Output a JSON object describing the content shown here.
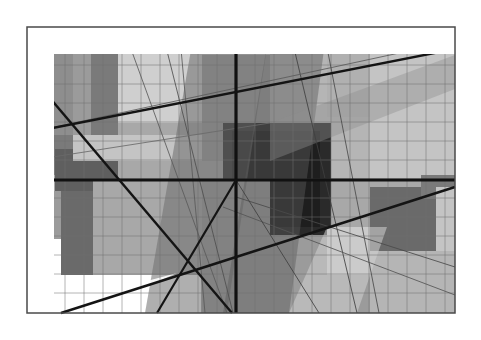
{
  "image": {
    "title": "Abstract Geometric Composition",
    "width": 481,
    "height": 340,
    "background_color": "#ffffff",
    "medium": "flat-color geometric abstraction",
    "style": "neoplastic / constructivist grid with overlaid diagonals"
  },
  "frame": {
    "name": "artwork-frame",
    "x": 27,
    "y": 27,
    "width": 428,
    "height": 286,
    "border_color": "#4a4a4a",
    "border_width": 1.5,
    "base_fill": "#a8a8a8"
  },
  "palette": {
    "white": "#ffffff",
    "near_white": "#f2f2f2",
    "light_gray": "#cfcfcf",
    "light_gray_2": "#c4c4c4",
    "mid_light_gray": "#b5b5b5",
    "mid_gray": "#a8a8a8",
    "mid_gray_2": "#9b9b9b",
    "gray": "#8e8e8e",
    "dark_gray": "#7a7a7a",
    "darker_gray": "#6a6a6a",
    "deep_gray": "#4f4f4f",
    "charcoal": "#3a3a3a",
    "near_black": "#1e1e1e",
    "black": "#111111",
    "grid_line": "#6f6f6f",
    "thin_line": "#555555"
  },
  "chart_data": {
    "type": "scatter",
    "xlabel": "",
    "ylabel": "",
    "xlim": [
      0,
      428
    ],
    "ylim": [
      0,
      286
    ],
    "grid": true,
    "legend": "none",
    "grid_vertical_x": [
      19,
      38,
      57,
      76,
      95,
      114,
      133,
      152,
      171,
      190,
      209,
      228,
      247,
      266,
      285,
      304,
      323,
      342,
      361,
      380,
      399,
      418
    ],
    "grid_horizontal_y": [
      19,
      38,
      57,
      76,
      95,
      114,
      133,
      152,
      171,
      190,
      209,
      228,
      247,
      266
    ],
    "rect_fields": [
      {
        "label": "left-dark-band-top",
        "x": 0,
        "y": 0,
        "w": 46,
        "h": 132,
        "fill": "#8e8e8e"
      },
      {
        "label": "left-pale-column",
        "x": 46,
        "y": 0,
        "w": 18,
        "h": 132,
        "fill": "#9b9b9b"
      },
      {
        "label": "second-dark-column",
        "x": 64,
        "y": 0,
        "w": 27,
        "h": 132,
        "fill": "#7a7a7a"
      },
      {
        "label": "upper-light-plane",
        "x": 91,
        "y": 0,
        "w": 84,
        "h": 96,
        "fill": "#cfcfcf"
      },
      {
        "label": "upper-mid-block",
        "x": 175,
        "y": 28,
        "w": 68,
        "h": 104,
        "fill": "#9b9b9b"
      },
      {
        "label": "upper-pale-strip",
        "x": 175,
        "y": 0,
        "w": 68,
        "h": 28,
        "fill": "#c4c4c4"
      },
      {
        "label": "upper-right-field",
        "x": 243,
        "y": 0,
        "w": 100,
        "h": 152,
        "fill": "#b5b5b5"
      },
      {
        "label": "far-right-light",
        "x": 343,
        "y": 0,
        "w": 85,
        "h": 152,
        "fill": "#c4c4c4"
      },
      {
        "label": "right-upper-tint",
        "x": 300,
        "y": 14,
        "w": 43,
        "h": 76,
        "fill": "#b0b0b0"
      },
      {
        "label": "midband-left-dark",
        "x": 0,
        "y": 108,
        "w": 46,
        "h": 40,
        "fill": "#7a7a7a"
      },
      {
        "label": "midband-left-darker",
        "x": 28,
        "y": 122,
        "w": 63,
        "h": 42,
        "fill": "#5f5f5f"
      },
      {
        "label": "mid-light-stripe",
        "x": 46,
        "y": 108,
        "w": 129,
        "h": 26,
        "fill": "#c4c4c4"
      },
      {
        "label": "center-dark-core",
        "x": 196,
        "y": 96,
        "w": 108,
        "h": 112,
        "fill": "#2a2a2a"
      },
      {
        "label": "center-core-inner",
        "x": 205,
        "y": 104,
        "w": 88,
        "h": 96,
        "fill": "#1e1e1e"
      },
      {
        "label": "lower-left-gray",
        "x": 0,
        "y": 164,
        "w": 46,
        "h": 64,
        "fill": "#9b9b9b"
      },
      {
        "label": "lower-left-white",
        "x": 0,
        "y": 212,
        "w": 34,
        "h": 74,
        "fill": "#ffffff"
      },
      {
        "label": "lower-left-white-2",
        "x": 34,
        "y": 248,
        "w": 140,
        "h": 38,
        "fill": "#ffffff"
      },
      {
        "label": "lower-dark-column",
        "x": 34,
        "y": 164,
        "w": 32,
        "h": 84,
        "fill": "#6a6a6a"
      },
      {
        "label": "lower-mid-plane",
        "x": 66,
        "y": 152,
        "w": 109,
        "h": 96,
        "fill": "#a8a8a8"
      },
      {
        "label": "lower-center-field",
        "x": 175,
        "y": 152,
        "w": 68,
        "h": 134,
        "fill": "#9b9b9b"
      },
      {
        "label": "lower-right-mid",
        "x": 243,
        "y": 208,
        "w": 100,
        "h": 78,
        "fill": "#9b9b9b"
      },
      {
        "label": "lower-right-light",
        "x": 300,
        "y": 200,
        "w": 60,
        "h": 48,
        "fill": "#c4c4c4"
      },
      {
        "label": "right-dark-block",
        "x": 343,
        "y": 160,
        "w": 66,
        "h": 64,
        "fill": "#6a6a6a"
      },
      {
        "label": "right-small-tint",
        "x": 394,
        "y": 148,
        "w": 34,
        "h": 24,
        "fill": "#7a7a7a"
      },
      {
        "label": "right-lower-light",
        "x": 343,
        "y": 224,
        "w": 85,
        "h": 62,
        "fill": "#b5b5b5"
      },
      {
        "label": "far-right-column",
        "x": 409,
        "y": 160,
        "w": 19,
        "h": 64,
        "fill": "#c4c4c4"
      }
    ],
    "diagonal_bands": [
      {
        "label": "central-dark-sweep",
        "points": "168,0 243,0 200,286 118,286",
        "fill": "#6e6e6e",
        "opacity": 0.55
      },
      {
        "label": "right-diagonal-wedge",
        "points": "243,0 300,0 262,286 196,286",
        "fill": "#5a5a5a",
        "opacity": 0.45
      },
      {
        "label": "upper-right-shear",
        "points": "243,96 428,28 428,62 243,134",
        "fill": "#8e8e8e",
        "opacity": 0.4
      },
      {
        "label": "lower-right-pale",
        "points": "262,286 330,286 360,200 300,200",
        "fill": "#d2d2d2",
        "opacity": 0.55
      },
      {
        "label": "lower-left-triangle",
        "points": "0,286 150,246 60,286",
        "fill": "#ffffff",
        "opacity": 0.9
      }
    ],
    "thick_lines": [
      {
        "label": "bold-vertical-axis",
        "x1": 209,
        "y1": 0,
        "x2": 209,
        "y2": 286,
        "width": 3.2,
        "color": "#111111"
      },
      {
        "label": "bold-horizontal-axis",
        "x1": 0,
        "y1": 153,
        "x2": 428,
        "y2": 153,
        "width": 3.2,
        "color": "#111111"
      },
      {
        "label": "bold-descending-diagonal",
        "x1": 0,
        "y1": 44,
        "x2": 205,
        "y2": 286,
        "width": 2.4,
        "color": "#141414"
      },
      {
        "label": "bold-ascending-diagonal",
        "x1": 0,
        "y1": 106,
        "x2": 428,
        "y2": 22,
        "width": 2.4,
        "color": "#141414"
      },
      {
        "label": "bold-low-rise",
        "x1": 34,
        "y1": 286,
        "x2": 428,
        "y2": 160,
        "width": 2.4,
        "color": "#141414"
      },
      {
        "label": "bold-center-fan",
        "x1": 209,
        "y1": 153,
        "x2": 130,
        "y2": 286,
        "width": 2.2,
        "color": "#141414"
      }
    ],
    "thin_lines": [
      {
        "label": "thin-steep-1",
        "x1": 96,
        "y1": 0,
        "x2": 200,
        "y2": 286,
        "width": 1.0,
        "color": "#5a5a5a"
      },
      {
        "label": "thin-steep-2",
        "x1": 134,
        "y1": 0,
        "x2": 206,
        "y2": 286,
        "width": 1.0,
        "color": "#4f4f4f"
      },
      {
        "label": "thin-steep-3",
        "x1": 152,
        "y1": 0,
        "x2": 178,
        "y2": 286,
        "width": 1.0,
        "color": "#5a5a5a"
      },
      {
        "label": "thin-steep-4",
        "x1": 262,
        "y1": 0,
        "x2": 330,
        "y2": 286,
        "width": 1.0,
        "color": "#3f3f3f"
      },
      {
        "label": "thin-steep-5",
        "x1": 296,
        "y1": 0,
        "x2": 352,
        "y2": 286,
        "width": 1.0,
        "color": "#4a4a4a"
      },
      {
        "label": "thin-shallow-1",
        "x1": 0,
        "y1": 106,
        "x2": 428,
        "y2": 14,
        "width": 1.0,
        "color": "#5a5a5a"
      },
      {
        "label": "thin-shallow-2",
        "x1": 0,
        "y1": 134,
        "x2": 243,
        "y2": 96,
        "width": 1.0,
        "color": "#6a6a6a"
      },
      {
        "label": "thin-shallow-3",
        "x1": 209,
        "y1": 170,
        "x2": 428,
        "y2": 240,
        "width": 1.0,
        "color": "#4a4a4a"
      },
      {
        "label": "thin-shallow-4",
        "x1": 196,
        "y1": 180,
        "x2": 428,
        "y2": 268,
        "width": 1.0,
        "color": "#555555"
      },
      {
        "label": "thin-fan-1",
        "x1": 209,
        "y1": 153,
        "x2": 292,
        "y2": 286,
        "width": 1.0,
        "color": "#3f3f3f"
      }
    ]
  }
}
